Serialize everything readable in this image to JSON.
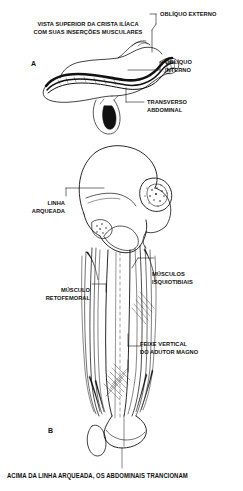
{
  "figure": {
    "title": "VISTA SUPERIOR DA CRISTA ILÍACA\nCOM SUAS INSERÇÕES MUSCULARES",
    "bottom_caption": "ACIMA DA LINHA ARQUEADA, OS ABDOMINAIS TRANCIONAM",
    "background_color": "#ffffff",
    "ink_color": "#111111"
  },
  "panels": [
    {
      "letter": "A",
      "name": "iliac-crest-superior-view"
    },
    {
      "letter": "B",
      "name": "pelvis-femur-anterior-view"
    }
  ],
  "labels": [
    {
      "id": "obliquo-externo",
      "text": "OBLÍQUO EXTERNO",
      "align": "left"
    },
    {
      "id": "obliquo-interno",
      "text": "OBLÍQUO\nINTERNO",
      "align": "left"
    },
    {
      "id": "transverso-abdominal",
      "text": "TRANSVERSO\nABDOMINAL",
      "align": "left"
    },
    {
      "id": "linha-arqueada",
      "text": "LINHA\nARQUEADA",
      "align": "right"
    },
    {
      "id": "musculos-isquiotibiais",
      "text": "MÚSCULOS\nISQUIOTIBIAIS",
      "align": "left"
    },
    {
      "id": "musculo-retofemoral",
      "text": "MÚSCULO\nRETOFEMORAL",
      "align": "right"
    },
    {
      "id": "feixe-vertical-adutor-magno",
      "text": "FEIXE VERTICAL\nDO ADUTOR MAGNO",
      "align": "left"
    }
  ]
}
